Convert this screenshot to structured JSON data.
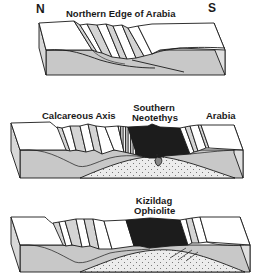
{
  "diagram": {
    "type": "geological-block-diagram-sequence",
    "panels": [
      {
        "id": "panel-1",
        "labels": {
          "north": "N",
          "south": "S",
          "title": "Northern Edge of Arabia"
        }
      },
      {
        "id": "panel-2",
        "labels": {
          "calcareous": "Calcareous Axis",
          "neotethys_line1": "Southern",
          "neotethys_line2": "Neotethys",
          "arabia": "Arabia"
        }
      },
      {
        "id": "panel-3",
        "labels": {
          "ophiolite_line1": "Kizildag",
          "ophiolite_line2": "Ophiolite"
        }
      }
    ],
    "colors": {
      "outline": "#1a1a1a",
      "block_top": "#ffffff",
      "block_side": "#c8c8c8",
      "fault_face": "#d4d4d4",
      "oceanic_crust": "#1c1c1c",
      "mantle_stipple": "#e6e6e6"
    }
  }
}
